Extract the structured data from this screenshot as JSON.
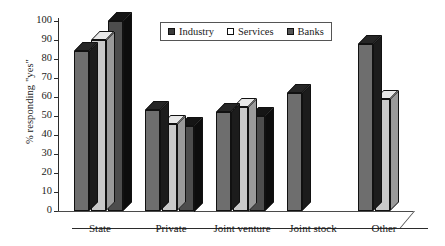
{
  "chart_data": {
    "type": "bar",
    "title": "",
    "subtitle": "",
    "xlabel": "",
    "ylabel": "% responding \"yes\"",
    "ylim": [
      0,
      100
    ],
    "yticks": [
      0,
      10,
      20,
      30,
      40,
      50,
      60,
      70,
      80,
      90,
      100
    ],
    "grid": false,
    "legend_position": "top-center",
    "style": "3d-clustered-column",
    "categories": [
      "State",
      "Private",
      "Joint venture",
      "Joint stock",
      "Other"
    ],
    "series": [
      {
        "name": "Industry",
        "color": "#6e6e6e",
        "values": [
          84,
          53,
          52,
          62,
          88
        ]
      },
      {
        "name": "Services",
        "color": "#c9c9c9",
        "values": [
          90,
          46,
          55,
          null,
          59
        ]
      },
      {
        "name": "Banks",
        "color": "#4d4d4d",
        "values": [
          100,
          45,
          50,
          null,
          null
        ]
      }
    ]
  },
  "legend": {
    "items": [
      {
        "label": "Industry",
        "icon": "legend-swatch-industry"
      },
      {
        "label": "Services",
        "icon": "legend-swatch-services"
      },
      {
        "label": "Banks",
        "icon": "legend-swatch-banks"
      }
    ]
  }
}
